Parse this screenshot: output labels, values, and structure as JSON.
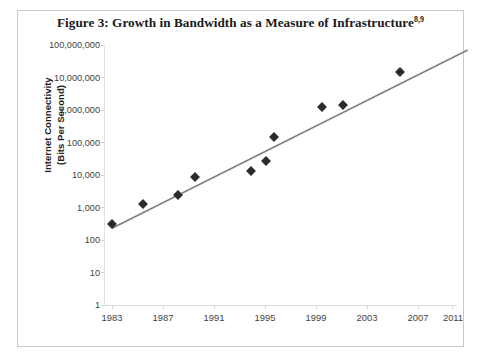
{
  "figure": {
    "title_main": "Figure 3: Growth in Bandwidth as a Measure of Infrastructure",
    "title_superscript": "8,9",
    "border_color": "#c9c9c9",
    "background": "#ffffff"
  },
  "axes": {
    "y_title_line1": "Internet Connectivity",
    "y_title_line2": "(Bits Per Second)",
    "y_ticks": [
      "100,000,000",
      "10,000,000",
      "1,000,000",
      "100,000",
      "10,000",
      "1,000",
      "100",
      "10",
      "1"
    ],
    "x_ticks": [
      "1983",
      "1987",
      "1991",
      "1995",
      "1999",
      "2003",
      "2007",
      "2011"
    ]
  },
  "chart_data": {
    "type": "scatter",
    "title": "Figure 3: Growth in Bandwidth as a Measure of Infrastructure",
    "xlabel": "",
    "ylabel": "Internet Connectivity (Bits Per Second)",
    "yscale": "log",
    "ylim": [
      1,
      100000000
    ],
    "xlim": [
      1983,
      2012
    ],
    "grid": false,
    "legend": "none",
    "y_tick_values": [
      1,
      10,
      100,
      1000,
      10000,
      100000,
      1000000,
      10000000,
      100000000
    ],
    "y_tick_labels": [
      "1",
      "10",
      "100",
      "1,000",
      "10,000",
      "100,000",
      "1,000,000",
      "10,000,000",
      "100,000,000"
    ],
    "x_tick_values": [
      1983,
      1987,
      1991,
      1995,
      1999,
      2003,
      2007,
      2011
    ],
    "x_tick_labels": [
      "1983",
      "1987",
      "1991",
      "1995",
      "1999",
      "2003",
      "2007",
      "2011"
    ],
    "series": [
      {
        "name": "Internet Connectivity",
        "marker": "diamond",
        "color": "#2b2b2b",
        "x": [
          1983,
          1985.4,
          1988.2,
          1989.5,
          1993.9,
          1995.1,
          1995.7,
          1999.5,
          2001.1,
          2005.6
        ],
        "y": [
          310,
          1280,
          2400,
          9000,
          13000,
          27000,
          150000,
          1200000,
          1400000,
          15000000
        ],
        "points": [
          {
            "year": 1983,
            "bits_per_second": 310
          },
          {
            "year": 1985,
            "bits_per_second": 1280
          },
          {
            "year": 1988,
            "bits_per_second": 2400
          },
          {
            "year": 1990,
            "bits_per_second": 9000
          },
          {
            "year": 1994,
            "bits_per_second": 13000
          },
          {
            "year": 1995,
            "bits_per_second": 27000
          },
          {
            "year": 1996,
            "bits_per_second": 150000
          },
          {
            "year": 2000,
            "bits_per_second": 1200000
          },
          {
            "year": 2001,
            "bits_per_second": 1400000
          },
          {
            "year": 2006,
            "bits_per_second": 15000000
          }
        ]
      }
    ],
    "trendline": {
      "type": "exponential",
      "color": "#808080",
      "x_start": 1983,
      "x_end": 2010.9,
      "y_start": 230,
      "y_end": 70000000
    }
  }
}
